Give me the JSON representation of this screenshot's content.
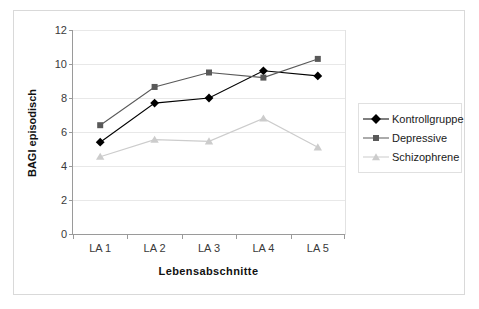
{
  "chart_data": {
    "type": "line",
    "title": "",
    "xlabel": "Lebensabschnitte",
    "ylabel": "BAGI episodisch",
    "categories": [
      "LA 1",
      "LA 2",
      "LA 3",
      "LA 4",
      "LA 5"
    ],
    "ylim": [
      0,
      12
    ],
    "yticks": [
      0,
      2,
      4,
      6,
      8,
      10,
      12
    ],
    "ytick_labels": [
      "0",
      "2",
      "4",
      "6",
      "8",
      "10",
      "12"
    ],
    "grid": true,
    "legend_position": "right",
    "series": [
      {
        "name": "Kontrollgruppe",
        "values": [
          5.4,
          7.7,
          8.0,
          9.6,
          9.3
        ],
        "color": "#000000",
        "marker": "diamond"
      },
      {
        "name": "Depressive",
        "values": [
          6.4,
          8.65,
          9.5,
          9.2,
          10.3
        ],
        "color": "#595959",
        "marker": "square"
      },
      {
        "name": "Schizophrene",
        "values": [
          4.55,
          5.55,
          5.45,
          6.8,
          5.1
        ],
        "color": "#cccccc",
        "marker": "triangle"
      }
    ]
  },
  "axes": {
    "y_title": "BAGI episodisch",
    "x_title": "Lebensabschnitte",
    "y_tick_0": "0",
    "y_tick_1": "2",
    "y_tick_2": "4",
    "y_tick_3": "6",
    "y_tick_4": "8",
    "y_tick_5": "10",
    "y_tick_6": "12",
    "x_tick_0": "LA 1",
    "x_tick_1": "LA 2",
    "x_tick_2": "LA 3",
    "x_tick_3": "LA 4",
    "x_tick_4": "LA 5"
  },
  "legend": {
    "items": [
      {
        "label": "Kontrollgruppe",
        "color": "#000000"
      },
      {
        "label": "Depressive",
        "color": "#595959"
      },
      {
        "label": "Schizophrene",
        "color": "#cccccc"
      }
    ]
  },
  "colors": {
    "kontrollgruppe": "#000000",
    "depressive": "#595959",
    "schizophrene": "#cccccc",
    "axis": "#9a9a9a",
    "grid": "#e8e8e8",
    "frame": "#d9d9d9"
  }
}
